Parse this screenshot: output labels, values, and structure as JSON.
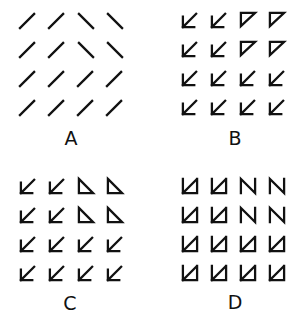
{
  "figure": {
    "panels": [
      {
        "id": "A",
        "label": "A",
        "origin": [
          19,
          12
        ],
        "label_pos": [
          56,
          128
        ],
        "rows": [
          [
            "slash",
            "slash",
            "backslash",
            "backslash"
          ],
          [
            "slash",
            "slash",
            "backslash",
            "backslash"
          ],
          [
            "slash",
            "slash",
            "slash",
            "slash"
          ],
          [
            "slash",
            "slash",
            "slash",
            "slash"
          ]
        ]
      },
      {
        "id": "B",
        "label": "B",
        "origin": [
          181,
          11
        ],
        "label_pos": [
          220,
          128
        ],
        "rows": [
          [
            "arrow-sw",
            "arrow-sw",
            "triangle-tl",
            "triangle-tl"
          ],
          [
            "arrow-sw",
            "arrow-sw",
            "triangle-tl",
            "triangle-tl"
          ],
          [
            "arrow-sw",
            "arrow-sw",
            "arrow-sw",
            "arrow-sw"
          ],
          [
            "arrow-sw",
            "arrow-sw",
            "arrow-sw",
            "arrow-sw"
          ]
        ]
      },
      {
        "id": "C",
        "label": "C",
        "origin": [
          19,
          177
        ],
        "label_pos": [
          55,
          293
        ],
        "rows": [
          [
            "arrow-sw",
            "arrow-sw",
            "triangle-bl",
            "triangle-bl"
          ],
          [
            "arrow-sw",
            "arrow-sw",
            "triangle-bl",
            "triangle-bl"
          ],
          [
            "arrow-sw",
            "arrow-sw",
            "arrow-sw",
            "arrow-sw"
          ],
          [
            "arrow-sw",
            "arrow-sw",
            "arrow-sw",
            "arrow-sw"
          ]
        ]
      },
      {
        "id": "D",
        "label": "D",
        "origin": [
          181,
          177
        ],
        "label_pos": [
          220,
          292
        ],
        "rows": [
          [
            "box-arrow",
            "box-arrow",
            "n-shape",
            "n-shape"
          ],
          [
            "box-arrow",
            "box-arrow",
            "n-shape",
            "n-shape"
          ],
          [
            "box-arrow",
            "box-arrow",
            "box-arrow",
            "box-arrow"
          ],
          [
            "box-arrow",
            "box-arrow",
            "box-arrow",
            "box-arrow"
          ]
        ]
      }
    ],
    "cell_spacing": [
      29,
      29
    ],
    "stroke_color": "#111111"
  }
}
